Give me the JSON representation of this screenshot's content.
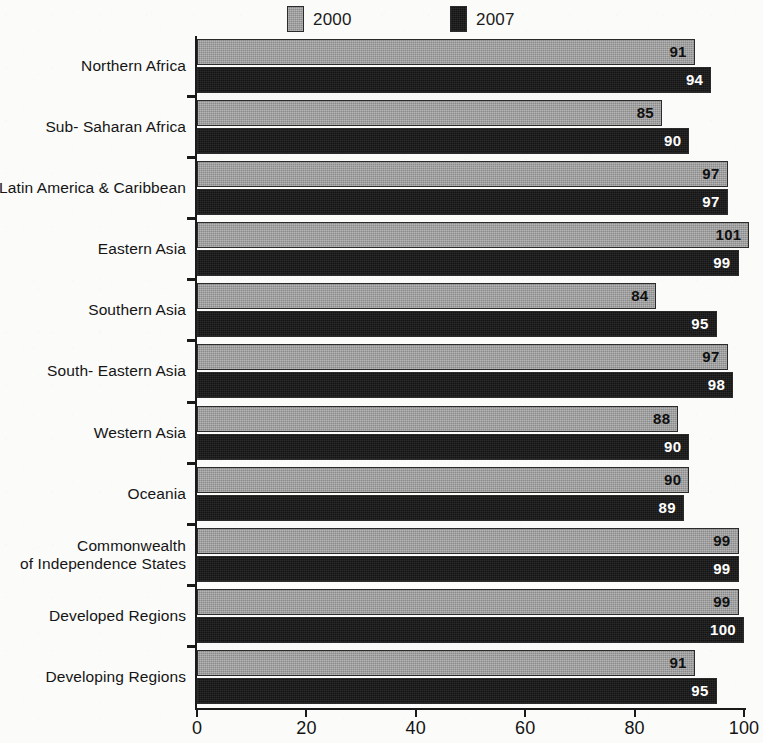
{
  "legend": {
    "entries": [
      {
        "label": "2000",
        "color": "#8a8a8a"
      },
      {
        "label": "2007",
        "color": "#141414"
      }
    ]
  },
  "axis": {
    "ticks": [
      "0",
      "20",
      "40",
      "60",
      "80",
      "100"
    ]
  },
  "chart_data": {
    "type": "bar",
    "orientation": "horizontal",
    "title": "",
    "subtitle": "",
    "xlabel": "",
    "ylabel": "",
    "xlim": [
      0,
      100
    ],
    "grid": false,
    "legend_position": "top-center",
    "tick_labels": [
      "0",
      "20",
      "40",
      "60",
      "80",
      "100"
    ],
    "categories": [
      "Northern Africa",
      "Sub- Saharan Africa",
      "Latin America & Caribbean",
      "Eastern Asia",
      "Southern Asia",
      "South- Eastern Asia",
      "Western Asia",
      "Oceania",
      "Commonwealth of Independence States",
      "Developed Regions",
      "Developing Regions"
    ],
    "category_lines": [
      [
        "Northern Africa"
      ],
      [
        "Sub- Saharan Africa"
      ],
      [
        "Latin America & Caribbean"
      ],
      [
        "Eastern Asia"
      ],
      [
        "Southern Asia"
      ],
      [
        "South- Eastern Asia"
      ],
      [
        "Western Asia"
      ],
      [
        "Oceania"
      ],
      [
        "Commonwealth",
        "of Independence States"
      ],
      [
        "Developed Regions"
      ],
      [
        "Developing Regions"
      ]
    ],
    "series": [
      {
        "name": "2000",
        "color": "#8a8a8a",
        "values": [
          91,
          85,
          97,
          101,
          84,
          97,
          88,
          90,
          99,
          99,
          91
        ]
      },
      {
        "name": "2007",
        "color": "#141414",
        "values": [
          94,
          90,
          97,
          99,
          95,
          98,
          90,
          89,
          99,
          100,
          95
        ]
      }
    ]
  }
}
